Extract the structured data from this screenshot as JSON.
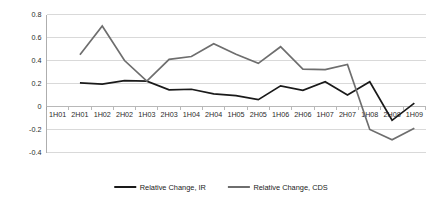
{
  "chart_data": {
    "type": "line",
    "title": "",
    "subtitle": "",
    "xlabel": "",
    "ylabel": "",
    "categories": [
      "1H01",
      "2H01",
      "1H02",
      "2H02",
      "1H03",
      "2H03",
      "1H04",
      "2H04",
      "1H05",
      "2H05",
      "1H06",
      "2H06",
      "1H07",
      "2H07",
      "1H08",
      "2H08",
      "1H09"
    ],
    "y_ticks": [
      0.8,
      0.6,
      0.4,
      0.2,
      0,
      -0.2,
      -0.4
    ],
    "y_tick_labels": [
      "0.8",
      "0.6",
      "0.4",
      "0.2",
      "0",
      "-0.2",
      "-0.4"
    ],
    "ylim": [
      -0.4,
      0.8
    ],
    "grid": true,
    "legend_position": "bottom",
    "series": [
      {
        "name": "Relative Change, IR",
        "color": "#1a1a1a",
        "line_width": 1.7,
        "values": [
          null,
          0.205,
          0.195,
          0.225,
          0.22,
          0.145,
          0.15,
          0.11,
          0.095,
          0.06,
          0.18,
          0.14,
          0.215,
          0.1,
          0.215,
          -0.12,
          0.03
        ]
      },
      {
        "name": "Relative Change, CDS",
        "color": "#6e6e6e",
        "line_width": 1.7,
        "values": [
          null,
          0.45,
          0.7,
          0.4,
          0.22,
          0.41,
          0.435,
          0.545,
          0.455,
          0.375,
          0.52,
          0.325,
          0.32,
          0.365,
          -0.2,
          -0.29,
          -0.19
        ]
      }
    ]
  },
  "legend": {
    "items": [
      {
        "label": "Relative Change, IR",
        "color": "#1a1a1a"
      },
      {
        "label": "Relative Change, CDS",
        "color": "#6e6e6e"
      }
    ]
  },
  "colors": {
    "background": "#ffffff",
    "grid": "#c9c9c9",
    "axis": "#9a9a9a",
    "text": "#2b2b2b",
    "series_ir": "#1a1a1a",
    "series_cds": "#6e6e6e"
  }
}
